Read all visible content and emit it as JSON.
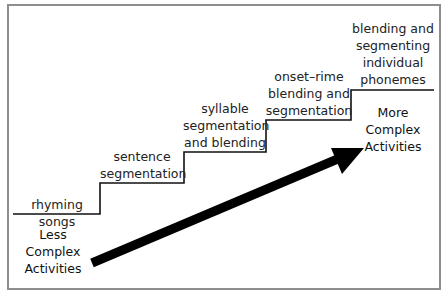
{
  "diagram": {
    "steps": [
      {
        "label": "rhyming songs"
      },
      {
        "label": "sentence\nsegmentation"
      },
      {
        "label": "syllable\nsegmentation\nand blending"
      },
      {
        "label": "onset–rime\nblending and\nsegmentation"
      },
      {
        "label": "blending and\nsegmenting\nindividual\nphonemes"
      }
    ],
    "start_caption": "Less\nComplex\nActivities",
    "end_caption": "More\nComplex\nActivities",
    "colors": {
      "frame": "#8e8e8e",
      "line": "#111111",
      "arrow": "#000000"
    }
  }
}
